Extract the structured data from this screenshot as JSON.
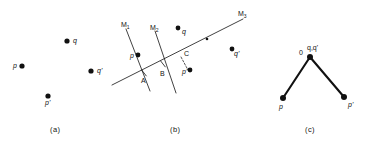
{
  "figure": {
    "panels": [
      {
        "id": "a",
        "caption": "(a)",
        "points": [
          {
            "name": "q",
            "label": "q",
            "x": 67,
            "y": 41,
            "label_x": 73,
            "label_y": 37,
            "r": 2.6
          },
          {
            "name": "p",
            "label": "p",
            "x": 22,
            "y": 66,
            "label_x": 13,
            "label_y": 62,
            "r": 2.6
          },
          {
            "name": "q-prime",
            "label": "q'",
            "x": 91,
            "y": 71,
            "label_x": 97,
            "label_y": 67,
            "r": 2.6
          },
          {
            "name": "p-prime",
            "label": "p'",
            "x": 48,
            "y": 96,
            "label_x": 45,
            "label_y": 99,
            "r": 2.6
          }
        ]
      },
      {
        "id": "b",
        "caption": "(b)",
        "lines": [
          {
            "name": "axis-m3",
            "x1": 112,
            "y1": 85,
            "x2": 243,
            "y2": 19,
            "width": 0.8,
            "dash": ""
          },
          {
            "name": "mirror-m1",
            "x1": 126,
            "y1": 29,
            "x2": 150,
            "y2": 91,
            "width": 0.8,
            "dash": ""
          },
          {
            "name": "mirror-m2",
            "x1": 155,
            "y1": 31,
            "x2": 176,
            "y2": 93,
            "width": 0.8,
            "dash": ""
          },
          {
            "name": "connector-c-pprime",
            "x1": 181,
            "y1": 57,
            "x2": 188,
            "y2": 70,
            "width": 0.7,
            "dash": "2,1.6"
          }
        ],
        "labels": [
          {
            "name": "label-m1",
            "base": "M",
            "sub": "1",
            "x": 121,
            "y": 21
          },
          {
            "name": "label-m2",
            "base": "M",
            "sub": "2",
            "x": 150,
            "y": 24
          },
          {
            "name": "label-m3",
            "base": "M",
            "sub": "3",
            "x": 238,
            "y": 10
          },
          {
            "name": "label-a",
            "base": "A",
            "sub": "",
            "x": 141,
            "y": 77
          },
          {
            "name": "label-b",
            "base": "B",
            "sub": "",
            "x": 160,
            "y": 70
          },
          {
            "name": "label-c",
            "base": "C",
            "sub": "",
            "x": 184,
            "y": 50
          }
        ],
        "points": [
          {
            "name": "p",
            "label": "p",
            "x": 138,
            "y": 55,
            "label_x": 130,
            "label_y": 52,
            "r": 2.4
          },
          {
            "name": "q",
            "label": "q",
            "x": 178,
            "y": 28,
            "label_x": 182,
            "label_y": 28,
            "r": 2.4
          },
          {
            "name": "q-prime",
            "label": "q'",
            "x": 232,
            "y": 49,
            "label_x": 234,
            "label_y": 50,
            "r": 2.4
          },
          {
            "name": "p-prime",
            "label": "p'",
            "x": 190,
            "y": 70,
            "label_x": 182,
            "label_y": 68,
            "r": 2.4
          },
          {
            "name": "midpoint-marker",
            "label": "",
            "x": 207,
            "y": 39,
            "label_x": 0,
            "label_y": 0,
            "r": 1.3
          }
        ],
        "tick_marks": [
          {
            "name": "tick-a",
            "x": 144,
            "y": 73
          },
          {
            "name": "tick-b",
            "x": 163,
            "y": 64
          }
        ]
      },
      {
        "id": "c",
        "caption": "(c)",
        "segments": [
          {
            "name": "segment-o-p",
            "x1": 310,
            "y1": 57,
            "x2": 283,
            "y2": 98,
            "width": 2.1
          },
          {
            "name": "segment-o-pprime",
            "x1": 310,
            "y1": 57,
            "x2": 344,
            "y2": 97,
            "width": 2.1
          }
        ],
        "points": [
          {
            "name": "apex-o",
            "label": "",
            "x": 310,
            "y": 57,
            "label_x": 0,
            "label_y": 0,
            "r": 3.0
          },
          {
            "name": "p",
            "label": "p",
            "x": 283,
            "y": 98,
            "label_x": 279,
            "label_y": 103,
            "r": 3.0
          },
          {
            "name": "p-prime",
            "label": "p'",
            "x": 344,
            "y": 97,
            "label_x": 348,
            "label_y": 101,
            "r": 3.0
          }
        ],
        "labels": [
          {
            "name": "label-origin",
            "base": "0",
            "sub": "",
            "x": 299,
            "y": 49
          },
          {
            "name": "label-q-qprime",
            "base": "q,q'",
            "sub": "",
            "x": 307,
            "y": 44
          }
        ]
      }
    ],
    "captions": [
      {
        "name": "caption-a",
        "text": "(a)",
        "x": 50,
        "y": 126
      },
      {
        "name": "caption-b",
        "text": "(b)",
        "x": 170,
        "y": 126
      },
      {
        "name": "caption-c",
        "text": "(c)",
        "x": 305,
        "y": 126
      }
    ],
    "style": {
      "stroke": "#111111",
      "point_fill": "#111111",
      "background": "#ffffff"
    }
  }
}
